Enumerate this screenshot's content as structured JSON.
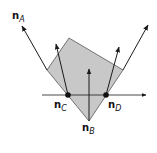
{
  "diagram": {
    "polygon_fill": "#c8c8c8",
    "polygon_stroke": "#555555",
    "line_color": "#1a1a1a",
    "vectors": [
      {
        "id": "A",
        "base": "n",
        "sub": "A"
      },
      {
        "id": "B",
        "base": "n",
        "sub": "B"
      },
      {
        "id": "C",
        "base": "n",
        "sub": "C"
      },
      {
        "id": "D",
        "base": "n",
        "sub": "D"
      }
    ]
  }
}
